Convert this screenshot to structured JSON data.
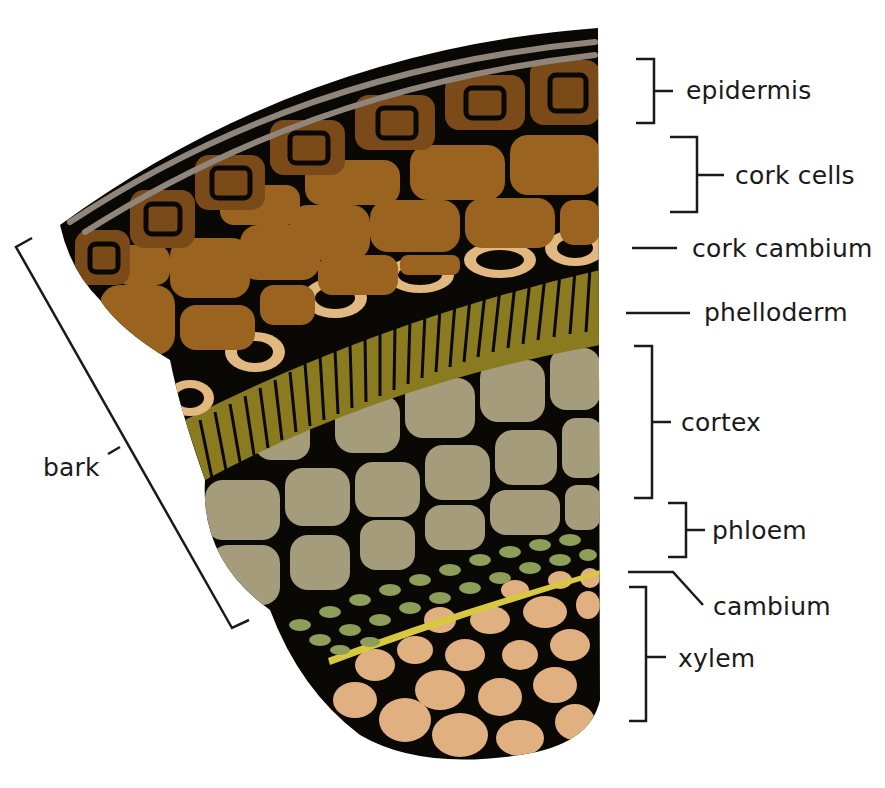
{
  "diagram": {
    "colors": {
      "outline": "#0a0805",
      "epidermis_gray": "#8f857a",
      "epidermis_cell": "#7a4a18",
      "cork_cell": "#9a6420",
      "cork_cambium": "#e0b880",
      "phelloderm": "#8a7a20",
      "phelloderm_stripe": "#b0a030",
      "cortex": "#a49c7a",
      "phloem": "#8c9e58",
      "cambium": "#d8c840",
      "xylem": "#e0b080"
    },
    "labels": {
      "epidermis": "epidermis",
      "cork_cells": "cork cells",
      "cork_cambium": "cork cambium",
      "phelloderm": "phelloderm",
      "cortex": "cortex",
      "phloem": "phloem",
      "cambium": "cambium",
      "xylem": "xylem",
      "bark": "bark"
    }
  }
}
